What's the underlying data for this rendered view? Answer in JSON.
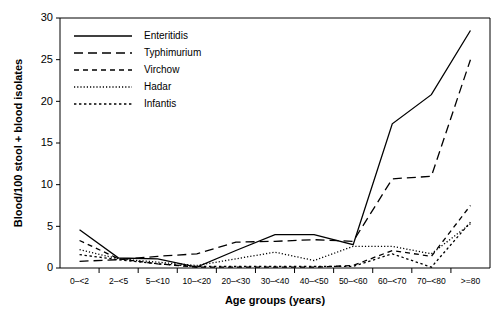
{
  "chart_data": {
    "type": "line",
    "title": "",
    "xlabel": "Age groups (years)",
    "ylabel": "Blood/100 stool + blood isolates",
    "categories": [
      "0–<2",
      "2–<5",
      "5–<10",
      "10–<20",
      "20–<30",
      "30–<40",
      "40–<50",
      "50–<60",
      "60–<70",
      "70–<80",
      ">=80"
    ],
    "ylim": [
      0,
      30
    ],
    "yticks": [
      0,
      5,
      10,
      15,
      20,
      25,
      30
    ],
    "grid": false,
    "legend_position": "top-left",
    "series": [
      {
        "name": "Enteritidis",
        "dash": "none",
        "values": [
          4.6,
          1.2,
          1.1,
          0.1,
          2.1,
          4.0,
          4.0,
          2.8,
          17.3,
          20.8,
          28.5
        ]
      },
      {
        "name": "Typhimurium",
        "dash": "long",
        "values": [
          0.8,
          1.0,
          1.4,
          1.7,
          3.1,
          3.2,
          3.4,
          3.2,
          10.7,
          11.0,
          25.0
        ]
      },
      {
        "name": "Virchow",
        "dash": "medium",
        "values": [
          3.3,
          1.1,
          0.5,
          0.1,
          0.1,
          0.1,
          0.1,
          0.3,
          2.1,
          1.4,
          7.5
        ]
      },
      {
        "name": "Hadar",
        "dash": "fine-dot",
        "values": [
          2.2,
          1.1,
          0.7,
          0.3,
          1.1,
          1.9,
          0.9,
          2.6,
          2.6,
          1.7,
          5.3
        ]
      },
      {
        "name": "Infantis",
        "dash": "dot",
        "values": [
          1.6,
          1.0,
          0.5,
          0.2,
          0.2,
          0.2,
          0.2,
          0.2,
          1.7,
          0.1,
          5.5
        ]
      }
    ]
  },
  "legend": {
    "entries": [
      {
        "label": "Enteritidis"
      },
      {
        "label": "Typhimurium"
      },
      {
        "label": "Virchow"
      },
      {
        "label": "Hadar"
      },
      {
        "label": "Infantis"
      }
    ]
  },
  "colors": {
    "ink": "#000000",
    "background": "#ffffff"
  }
}
